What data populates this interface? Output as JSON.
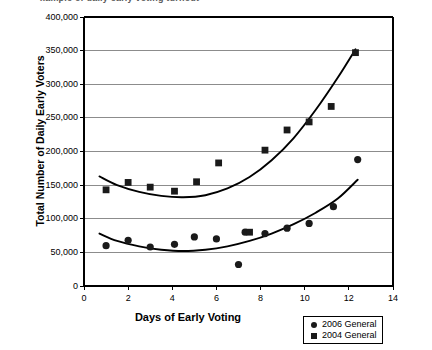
{
  "clipped_header_text": "xample of daily early voting turnout",
  "chart_data": {
    "type": "scatter",
    "title": "",
    "xlabel": "Days of Early Voting",
    "ylabel": "Total Number of Daily Early Voters",
    "xlim": [
      0,
      14
    ],
    "ylim": [
      0,
      400000
    ],
    "xticks": [
      0,
      2,
      4,
      6,
      8,
      10,
      12,
      14
    ],
    "xtick_labels": [
      "0",
      "2",
      "4",
      "6",
      "8",
      "10",
      "12",
      "14"
    ],
    "yticks": [
      0,
      50000,
      100000,
      150000,
      200000,
      250000,
      300000,
      350000,
      400000
    ],
    "ytick_labels": [
      "0",
      "50,000",
      "100,000",
      "150,000",
      "200,000",
      "250,000",
      "300,000",
      "350,000",
      "400,000"
    ],
    "grid": "horizontal",
    "legend_position": "bottom-right",
    "series": [
      {
        "name": "2006 General",
        "marker": "circle",
        "color": "#1a1a1a",
        "points": [
          {
            "x": 1.0,
            "y": 60000
          },
          {
            "x": 2.0,
            "y": 68000
          },
          {
            "x": 3.0,
            "y": 58000
          },
          {
            "x": 4.1,
            "y": 62000
          },
          {
            "x": 5.0,
            "y": 73000
          },
          {
            "x": 6.0,
            "y": 70000
          },
          {
            "x": 7.0,
            "y": 32000
          },
          {
            "x": 7.3,
            "y": 80000
          },
          {
            "x": 8.2,
            "y": 78000
          },
          {
            "x": 9.2,
            "y": 86000
          },
          {
            "x": 10.2,
            "y": 93000
          },
          {
            "x": 11.3,
            "y": 118000
          },
          {
            "x": 12.4,
            "y": 188000
          }
        ],
        "trend": [
          {
            "x": 0.7,
            "y": 78000
          },
          {
            "x": 1.5,
            "y": 67000
          },
          {
            "x": 2.5,
            "y": 59000
          },
          {
            "x": 3.5,
            "y": 54000
          },
          {
            "x": 4.5,
            "y": 52000
          },
          {
            "x": 5.5,
            "y": 54000
          },
          {
            "x": 6.5,
            "y": 59000
          },
          {
            "x": 7.5,
            "y": 67000
          },
          {
            "x": 8.5,
            "y": 78000
          },
          {
            "x": 9.5,
            "y": 92000
          },
          {
            "x": 10.5,
            "y": 109000
          },
          {
            "x": 11.5,
            "y": 130000
          },
          {
            "x": 12.4,
            "y": 158000
          }
        ]
      },
      {
        "name": "2004 General",
        "marker": "square",
        "color": "#1a1a1a",
        "points": [
          {
            "x": 1.0,
            "y": 143000
          },
          {
            "x": 2.0,
            "y": 154000
          },
          {
            "x": 3.0,
            "y": 147000
          },
          {
            "x": 4.1,
            "y": 141000
          },
          {
            "x": 5.1,
            "y": 155000
          },
          {
            "x": 6.1,
            "y": 183000
          },
          {
            "x": 7.5,
            "y": 80000
          },
          {
            "x": 8.2,
            "y": 202000
          },
          {
            "x": 9.2,
            "y": 232000
          },
          {
            "x": 10.2,
            "y": 244000
          },
          {
            "x": 11.2,
            "y": 267000
          },
          {
            "x": 12.3,
            "y": 347000
          }
        ],
        "trend": [
          {
            "x": 0.7,
            "y": 163000
          },
          {
            "x": 1.5,
            "y": 150000
          },
          {
            "x": 2.5,
            "y": 140000
          },
          {
            "x": 3.5,
            "y": 134000
          },
          {
            "x": 4.5,
            "y": 132000
          },
          {
            "x": 5.5,
            "y": 135000
          },
          {
            "x": 6.5,
            "y": 145000
          },
          {
            "x": 7.5,
            "y": 162000
          },
          {
            "x": 8.5,
            "y": 187000
          },
          {
            "x": 9.5,
            "y": 220000
          },
          {
            "x": 10.5,
            "y": 262000
          },
          {
            "x": 11.5,
            "y": 310000
          },
          {
            "x": 12.3,
            "y": 352000
          }
        ]
      }
    ]
  },
  "legend": {
    "items": [
      {
        "label": "2006 General",
        "marker": "circle"
      },
      {
        "label": "2004 General",
        "marker": "square"
      }
    ]
  }
}
